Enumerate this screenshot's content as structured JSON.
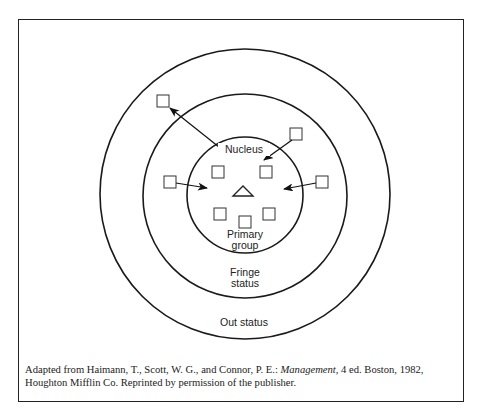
{
  "diagram": {
    "labels": {
      "nucleus": "Nucleus",
      "primary_line1": "Primary",
      "primary_line2": "group",
      "fringe_line1": "Fringe",
      "fringe_line2": "status",
      "out": "Out status"
    },
    "rings": [
      {
        "name": "primary-group",
        "cx": 245,
        "cy": 195,
        "r": 58
      },
      {
        "name": "fringe-status",
        "cx": 245,
        "cy": 196,
        "r": 102
      },
      {
        "name": "out-status",
        "cx": 245,
        "cy": 194,
        "r": 145
      }
    ],
    "members": {
      "nucleus": "triangle",
      "primary_group_squares": 5,
      "outside_squares": 4
    },
    "arrows": [
      {
        "from": "nucleus-area",
        "to": "out-status",
        "direction": "outward"
      },
      {
        "from": "fringe-status",
        "to": "primary-group",
        "direction": "inward",
        "position": "upper-right"
      },
      {
        "from": "fringe-status",
        "to": "primary-group",
        "direction": "inward",
        "position": "left"
      },
      {
        "from": "fringe-status",
        "to": "primary-group",
        "direction": "inward",
        "position": "right"
      }
    ]
  },
  "caption": {
    "prefix": "Adapted from Haimann, T., Scott, W. G., and Connor, P. E.: ",
    "title": "Management,",
    "suffix_line1": " 4 ed. Boston, 1982,",
    "line2": "Houghton Mifflin Co. Reprinted by permission of the publisher."
  }
}
